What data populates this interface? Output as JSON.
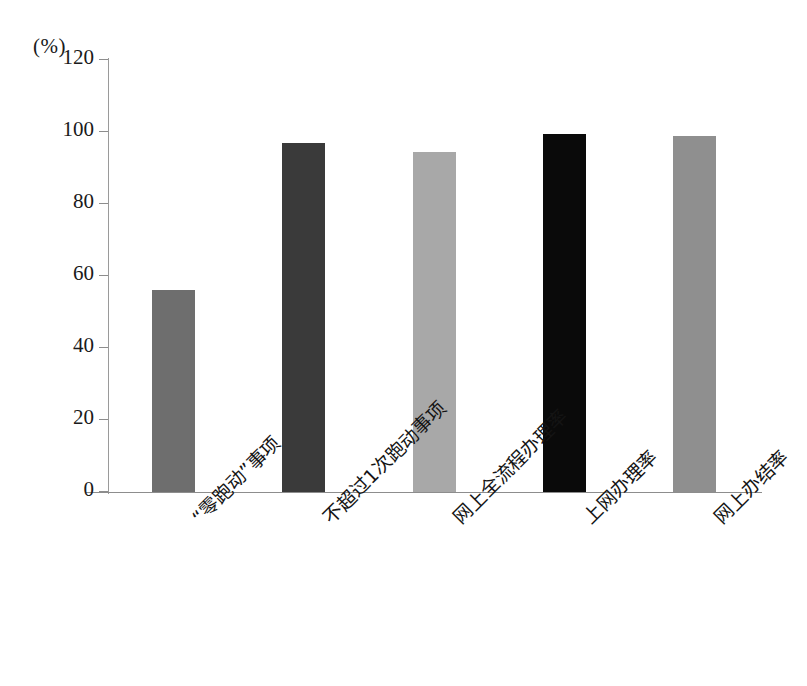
{
  "chart_data": {
    "type": "bar",
    "title": "",
    "subtitle": "",
    "xlabel": "",
    "ylabel": "",
    "unit_label": "(%)",
    "ylim": [
      0,
      120
    ],
    "ytick_step": 20,
    "yticks": [
      120,
      100,
      80,
      60,
      40,
      20,
      0
    ],
    "grid": false,
    "legend": "none",
    "categories": [
      "“零跑动”事项",
      "不超过1次跑动事项",
      "网上全流程办理率",
      "上网办理率",
      "网上办结率"
    ],
    "values": [
      56,
      97,
      94.5,
      99.5,
      99
    ],
    "bar_colors": [
      "#6e6e6e",
      "#3a3a3a",
      "#a8a8a8",
      "#0a0a0a",
      "#8f8f8f"
    ],
    "axis_color": "#8d8d8d",
    "background": "#ffffff"
  }
}
